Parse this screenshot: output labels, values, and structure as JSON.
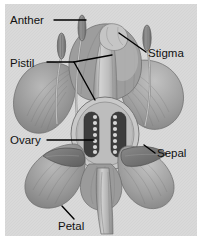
{
  "figure": {
    "type": "botanical-diagram",
    "background_color": "#ffffff",
    "plate_color": "#d9d9d9",
    "label_color": "#111111",
    "leader_color": "#000000"
  },
  "labels": {
    "anther": "Anther",
    "stigma": "Stigma",
    "pistil": "Pistil",
    "ovary": "Ovary",
    "sepal": "Sepal",
    "petal": "Petal"
  },
  "parts": [
    {
      "name": "anther",
      "label": "Anther",
      "side": "left-top"
    },
    {
      "name": "stigma",
      "label": "Stigma",
      "side": "right-top"
    },
    {
      "name": "pistil",
      "label": "Pistil",
      "side": "left-upper",
      "leader_branches": 2
    },
    {
      "name": "ovary",
      "label": "Ovary",
      "side": "left-middle"
    },
    {
      "name": "sepal",
      "label": "Sepal",
      "side": "right-lower"
    },
    {
      "name": "petal",
      "label": "Petal",
      "side": "bottom"
    }
  ]
}
